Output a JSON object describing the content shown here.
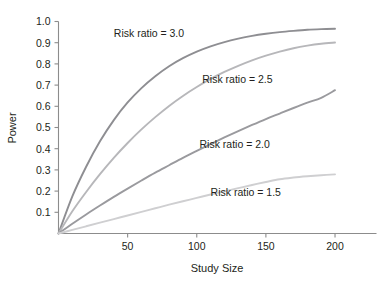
{
  "chart_data": {
    "type": "line",
    "title": "",
    "xlabel": "Study Size",
    "ylabel": "Power",
    "xlim": [
      0,
      230
    ],
    "ylim": [
      0,
      1.0
    ],
    "grid": false,
    "legend_position": "inline-annotations",
    "x_ticks": [
      50,
      100,
      150,
      200
    ],
    "x_tick_labels": [
      "50",
      "100",
      "150",
      "200"
    ],
    "y_ticks": [
      0.1,
      0.2,
      0.3,
      0.4,
      0.5,
      0.6,
      0.7,
      0.8,
      0.9,
      1.0
    ],
    "y_tick_labels": [
      "0.1",
      "0.2",
      "0.3",
      "0.4",
      "0.5",
      "0.6",
      "0.7",
      "0.8",
      "0.9",
      "1.0"
    ],
    "x": [
      0,
      10,
      20,
      30,
      40,
      50,
      60,
      70,
      80,
      90,
      100,
      110,
      120,
      130,
      140,
      150,
      160,
      170,
      180,
      190,
      200
    ],
    "series": [
      {
        "name": "Risk ratio = 3.0",
        "color": "#8e8e92",
        "label": "Risk ratio = 3.0",
        "label_x": 40,
        "label_y": 0.925,
        "values": [
          0.0,
          0.175,
          0.315,
          0.435,
          0.535,
          0.618,
          0.686,
          0.742,
          0.789,
          0.827,
          0.858,
          0.883,
          0.903,
          0.919,
          0.932,
          0.942,
          0.95,
          0.956,
          0.961,
          0.964,
          0.966
        ]
      },
      {
        "name": "Risk ratio = 2.5",
        "color": "#b7b7ba",
        "label": "Risk ratio = 2.5",
        "label_x": 104,
        "label_y": 0.71,
        "values": [
          0.0,
          0.105,
          0.196,
          0.28,
          0.357,
          0.427,
          0.491,
          0.549,
          0.602,
          0.649,
          0.691,
          0.729,
          0.762,
          0.791,
          0.817,
          0.839,
          0.858,
          0.874,
          0.886,
          0.895,
          0.901
        ]
      },
      {
        "name": "Risk ratio = 2.0",
        "color": "#9a9a9e",
        "label": "Risk ratio = 2.0",
        "label_x": 102,
        "label_y": 0.405,
        "values": [
          0.0,
          0.046,
          0.09,
          0.132,
          0.173,
          0.212,
          0.25,
          0.287,
          0.322,
          0.357,
          0.39,
          0.422,
          0.453,
          0.483,
          0.512,
          0.54,
          0.566,
          0.592,
          0.617,
          0.64,
          0.676
        ]
      },
      {
        "name": "Risk ratio = 1.5",
        "color": "#cfcfd1",
        "label": "Risk ratio = 1.5",
        "label_x": 110,
        "label_y": 0.175,
        "values": [
          0.0,
          0.017,
          0.034,
          0.051,
          0.068,
          0.085,
          0.102,
          0.119,
          0.136,
          0.152,
          0.168,
          0.184,
          0.199,
          0.214,
          0.229,
          0.243,
          0.256,
          0.264,
          0.27,
          0.275,
          0.279
        ]
      }
    ]
  }
}
